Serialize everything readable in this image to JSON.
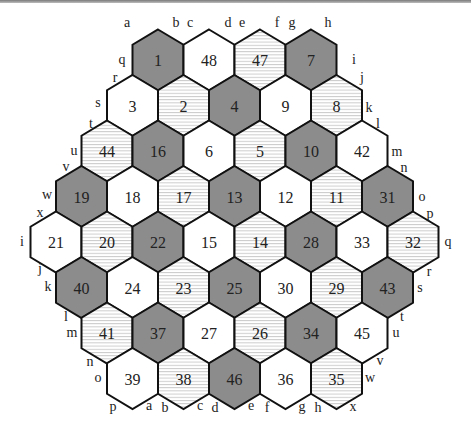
{
  "figure": {
    "type": "hexagonal board",
    "colors": {
      "dark": "#8c8c8c",
      "striped_base": "#ffffff",
      "stripe": "#c8c8c8",
      "white": "#ffffff",
      "outline": "#111111"
    },
    "hex_geometry": {
      "row0_y": 60,
      "row_step": 45.5,
      "col_step": 51,
      "half_width": 25.5,
      "radius": 30.5
    },
    "rows": [
      {
        "y_index": 0,
        "x_start": 158,
        "cells": [
          {
            "n": "1",
            "fill": "dark"
          },
          {
            "n": "48",
            "fill": "white"
          },
          {
            "n": "47",
            "fill": "striped"
          },
          {
            "n": "7",
            "fill": "dark"
          }
        ]
      },
      {
        "y_index": 1,
        "x_start": 132.5,
        "cells": [
          {
            "n": "3",
            "fill": "white"
          },
          {
            "n": "2",
            "fill": "striped"
          },
          {
            "n": "4",
            "fill": "dark"
          },
          {
            "n": "9",
            "fill": "white"
          },
          {
            "n": "8",
            "fill": "striped"
          }
        ]
      },
      {
        "y_index": 2,
        "x_start": 107,
        "cells": [
          {
            "n": "44",
            "fill": "striped"
          },
          {
            "n": "16",
            "fill": "dark"
          },
          {
            "n": "6",
            "fill": "white"
          },
          {
            "n": "5",
            "fill": "striped"
          },
          {
            "n": "10",
            "fill": "dark"
          },
          {
            "n": "42",
            "fill": "white"
          }
        ]
      },
      {
        "y_index": 3,
        "x_start": 81.5,
        "cells": [
          {
            "n": "19",
            "fill": "dark"
          },
          {
            "n": "18",
            "fill": "white"
          },
          {
            "n": "17",
            "fill": "striped"
          },
          {
            "n": "13",
            "fill": "dark"
          },
          {
            "n": "12",
            "fill": "white"
          },
          {
            "n": "11",
            "fill": "striped"
          },
          {
            "n": "31",
            "fill": "dark"
          }
        ]
      },
      {
        "y_index": 4,
        "x_start": 56,
        "cells": [
          {
            "n": "21",
            "fill": "white"
          },
          {
            "n": "20",
            "fill": "striped"
          },
          {
            "n": "22",
            "fill": "dark"
          },
          {
            "n": "15",
            "fill": "white"
          },
          {
            "n": "14",
            "fill": "striped"
          },
          {
            "n": "28",
            "fill": "dark"
          },
          {
            "n": "33",
            "fill": "white"
          },
          {
            "n": "32",
            "fill": "striped"
          }
        ]
      },
      {
        "y_index": 5,
        "x_start": 81.5,
        "cells": [
          {
            "n": "40",
            "fill": "dark"
          },
          {
            "n": "24",
            "fill": "white"
          },
          {
            "n": "23",
            "fill": "striped"
          },
          {
            "n": "25",
            "fill": "dark"
          },
          {
            "n": "30",
            "fill": "white"
          },
          {
            "n": "29",
            "fill": "striped"
          },
          {
            "n": "43",
            "fill": "dark"
          }
        ]
      },
      {
        "y_index": 6,
        "x_start": 107,
        "cells": [
          {
            "n": "41",
            "fill": "striped"
          },
          {
            "n": "37",
            "fill": "dark"
          },
          {
            "n": "27",
            "fill": "white"
          },
          {
            "n": "26",
            "fill": "striped"
          },
          {
            "n": "34",
            "fill": "dark"
          },
          {
            "n": "45",
            "fill": "white"
          }
        ]
      },
      {
        "y_index": 7,
        "x_start": 132.5,
        "cells": [
          {
            "n": "39",
            "fill": "white"
          },
          {
            "n": "38",
            "fill": "striped"
          },
          {
            "n": "46",
            "fill": "dark"
          },
          {
            "n": "36",
            "fill": "white"
          },
          {
            "n": "35",
            "fill": "striped"
          }
        ]
      }
    ],
    "edge_labels": [
      {
        "t": "a",
        "x": 127,
        "y": 27
      },
      {
        "t": "b",
        "x": 176,
        "y": 27
      },
      {
        "t": "c",
        "x": 190,
        "y": 27
      },
      {
        "t": "d",
        "x": 228,
        "y": 27
      },
      {
        "t": "e",
        "x": 242,
        "y": 27
      },
      {
        "t": "f",
        "x": 277,
        "y": 27
      },
      {
        "t": "g",
        "x": 292,
        "y": 27
      },
      {
        "t": "h",
        "x": 328,
        "y": 27
      },
      {
        "t": "i",
        "x": 354,
        "y": 64
      },
      {
        "t": "j",
        "x": 362,
        "y": 82
      },
      {
        "t": "k",
        "x": 369,
        "y": 112
      },
      {
        "t": "l",
        "x": 378,
        "y": 128
      },
      {
        "t": "m",
        "x": 397,
        "y": 156
      },
      {
        "t": "n",
        "x": 404,
        "y": 172
      },
      {
        "t": "o",
        "x": 422,
        "y": 201
      },
      {
        "t": "p",
        "x": 430,
        "y": 218
      },
      {
        "t": "q",
        "x": 448,
        "y": 246
      },
      {
        "t": "r",
        "x": 429,
        "y": 276
      },
      {
        "t": "s",
        "x": 420,
        "y": 292
      },
      {
        "t": "t",
        "x": 402,
        "y": 321
      },
      {
        "t": "u",
        "x": 396,
        "y": 337
      },
      {
        "t": "v",
        "x": 380,
        "y": 365
      },
      {
        "t": "w",
        "x": 370,
        "y": 382
      },
      {
        "t": "x",
        "x": 353,
        "y": 411
      },
      {
        "t": "h",
        "x": 318,
        "y": 412
      },
      {
        "t": "g",
        "x": 302,
        "y": 411
      },
      {
        "t": "f",
        "x": 267,
        "y": 412
      },
      {
        "t": "e",
        "x": 251,
        "y": 410
      },
      {
        "t": "d",
        "x": 215,
        "y": 412
      },
      {
        "t": "c",
        "x": 200,
        "y": 410
      },
      {
        "t": "b",
        "x": 165,
        "y": 412
      },
      {
        "t": "a",
        "x": 149,
        "y": 410
      },
      {
        "t": "p",
        "x": 113,
        "y": 411
      },
      {
        "t": "o",
        "x": 98,
        "y": 382
      },
      {
        "t": "n",
        "x": 90,
        "y": 366
      },
      {
        "t": "m",
        "x": 72,
        "y": 337
      },
      {
        "t": "l",
        "x": 66,
        "y": 321
      },
      {
        "t": "k",
        "x": 48,
        "y": 291
      },
      {
        "t": "j",
        "x": 40,
        "y": 273
      },
      {
        "t": "i",
        "x": 22,
        "y": 246
      },
      {
        "t": "x",
        "x": 40,
        "y": 217
      },
      {
        "t": "w",
        "x": 47,
        "y": 199
      },
      {
        "t": "v",
        "x": 66,
        "y": 171
      },
      {
        "t": "u",
        "x": 74,
        "y": 155
      },
      {
        "t": "t",
        "x": 91,
        "y": 128
      },
      {
        "t": "s",
        "x": 98,
        "y": 107
      },
      {
        "t": "r",
        "x": 115,
        "y": 82
      },
      {
        "t": "q",
        "x": 122,
        "y": 64
      }
    ]
  }
}
